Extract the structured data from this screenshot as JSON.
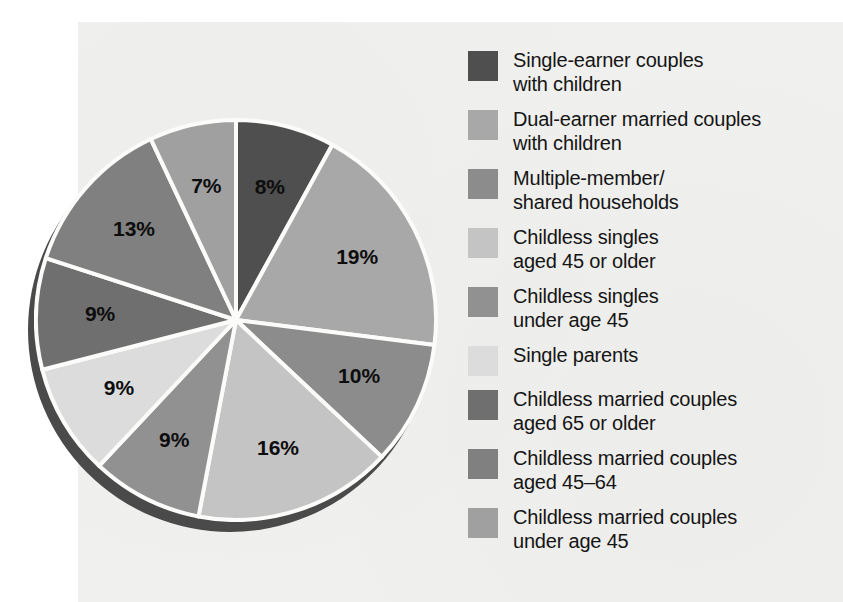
{
  "chart_data": {
    "type": "pie",
    "title": "",
    "subtitle": "",
    "xlabel": "",
    "ylabel": "",
    "legend_position": "right",
    "grid": false,
    "categories": [
      "Single-earner couples with children",
      "Dual-earner married couples with children",
      "Multiple-member/ shared households",
      "Childless singles aged 45 or older",
      "Childless singles under age 45",
      "Single parents",
      "Childless married couples aged 65 or older",
      "Childless married couples aged 45–64",
      "Childless married couples under age 45"
    ],
    "values": [
      8,
      19,
      10,
      16,
      9,
      9,
      9,
      13,
      7
    ],
    "value_labels": [
      "8%",
      "19%",
      "10%",
      "16%",
      "9%",
      "9%",
      "9%",
      "13%",
      "7%"
    ],
    "colors": [
      "#4f4f4f",
      "#a8a8a8",
      "#8c8c8c",
      "#c4c4c4",
      "#919191",
      "#dcdcdc",
      "#6f6f6f",
      "#808080",
      "#a0a0a0"
    ],
    "slices": [
      {
        "label": "8%",
        "value": 8,
        "category": "Single-earner couples with children",
        "color": "#4f4f4f"
      },
      {
        "label": "19%",
        "value": 19,
        "category": "Dual-earner married couples with children",
        "color": "#a8a8a8"
      },
      {
        "label": "10%",
        "value": 10,
        "category": "Multiple-member/ shared households",
        "color": "#8c8c8c"
      },
      {
        "label": "16%",
        "value": 16,
        "category": "Childless singles aged 45 or older",
        "color": "#c4c4c4"
      },
      {
        "label": "9%",
        "value": 9,
        "category": "Childless singles under age 45",
        "color": "#919191"
      },
      {
        "label": "9%",
        "value": 9,
        "category": "Single parents",
        "color": "#dcdcdc"
      },
      {
        "label": "9%",
        "value": 9,
        "category": "Childless married couples aged 65 or older",
        "color": "#6f6f6f"
      },
      {
        "label": "13%",
        "value": 13,
        "category": "Childless married couples aged 45–64",
        "color": "#808080"
      },
      {
        "label": "7%",
        "value": 7,
        "category": "Childless married couples under age 45",
        "color": "#a0a0a0"
      }
    ]
  },
  "legend": {
    "items": [
      {
        "label": "Single-earner couples\nwith children",
        "color": "#4f4f4f"
      },
      {
        "label": "Dual-earner married couples\nwith children",
        "color": "#a8a8a8"
      },
      {
        "label": "Multiple-member/\nshared households",
        "color": "#8c8c8c"
      },
      {
        "label": "Childless singles\naged 45 or older",
        "color": "#c4c4c4"
      },
      {
        "label": "Childless singles\nunder age 45",
        "color": "#919191"
      },
      {
        "label": "Single parents",
        "color": "#dcdcdc"
      },
      {
        "label": "Childless married couples\naged 65 or older",
        "color": "#6f6f6f"
      },
      {
        "label": "Childless married couples\naged 45–64",
        "color": "#808080"
      },
      {
        "label": "Childless married couples\nunder age 45",
        "color": "#a0a0a0"
      }
    ]
  },
  "style": {
    "paper_background": "#f0f0ee",
    "page_background": "#ffffff",
    "slice_divider": "#fbfbfa",
    "pie_shadow": "#4a4a4a",
    "label_color": "#0d0d0d"
  }
}
